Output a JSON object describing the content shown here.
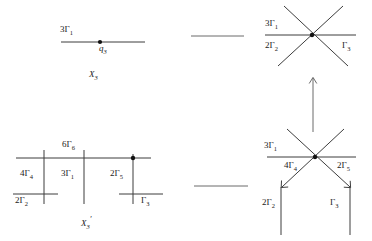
{
  "figure": {
    "title": "",
    "panels": [
      {
        "id": "top-left",
        "name": "X3-single-line",
        "bottom_label": "X",
        "bottom_label_sub": "3",
        "bottom_label_prime": "",
        "labels": [
          {
            "text": "3",
            "sub": "1",
            "greek": "Γ",
            "role": "branch-label"
          },
          {
            "text": "",
            "sub": "3",
            "greek": "q",
            "role": "point-label"
          }
        ]
      },
      {
        "id": "top-right",
        "name": "X3-star-three-branch",
        "labels": [
          {
            "text": "3",
            "sub": "1",
            "greek": "Γ"
          },
          {
            "text": "2",
            "sub": "2",
            "greek": "Γ"
          },
          {
            "text": "",
            "sub": "3",
            "greek": "Γ"
          }
        ]
      },
      {
        "id": "bottom-left",
        "name": "X3prime-comb",
        "bottom_label": "X",
        "bottom_label_sub": "3",
        "bottom_label_prime": "′",
        "labels": [
          {
            "text": "6",
            "sub": "6",
            "greek": "Γ"
          },
          {
            "text": "4",
            "sub": "4",
            "greek": "Γ"
          },
          {
            "text": "3",
            "sub": "1",
            "greek": "Γ"
          },
          {
            "text": "2",
            "sub": "5",
            "greek": "Γ"
          },
          {
            "text": "2",
            "sub": "2",
            "greek": "Γ"
          },
          {
            "text": "",
            "sub": "3",
            "greek": "Γ"
          }
        ]
      },
      {
        "id": "bottom-right",
        "name": "X3prime-star-five-branch",
        "labels": [
          {
            "text": "3",
            "sub": "1",
            "greek": "Γ"
          },
          {
            "text": "4",
            "sub": "4",
            "greek": "Γ"
          },
          {
            "text": "2",
            "sub": "5",
            "greek": "Γ"
          },
          {
            "text": "2",
            "sub": "2",
            "greek": "Γ"
          },
          {
            "text": "",
            "sub": "3",
            "greek": "Γ"
          }
        ]
      }
    ]
  },
  "top_left": {
    "branch_main": {
      "coeff": "3",
      "symbol": "Γ",
      "sub": "1"
    },
    "point": {
      "symbol": "q",
      "sub": "3"
    },
    "caption": {
      "symbol": "X",
      "sub": "3",
      "prime": ""
    }
  },
  "top_right": {
    "upper_left": {
      "coeff": "3",
      "symbol": "Γ",
      "sub": "1"
    },
    "lower_left": {
      "coeff": "2",
      "symbol": "Γ",
      "sub": "2"
    },
    "lower_right": {
      "coeff": "",
      "symbol": "Γ",
      "sub": "3"
    }
  },
  "bottom_left": {
    "top_center": {
      "coeff": "6",
      "symbol": "Γ",
      "sub": "6"
    },
    "left_mid": {
      "coeff": "4",
      "symbol": "Γ",
      "sub": "4"
    },
    "center_mid": {
      "coeff": "3",
      "symbol": "Γ",
      "sub": "1"
    },
    "right_mid": {
      "coeff": "2",
      "symbol": "Γ",
      "sub": "5"
    },
    "left_bottom": {
      "coeff": "2",
      "symbol": "Γ",
      "sub": "2"
    },
    "right_bottom": {
      "coeff": "",
      "symbol": "Γ",
      "sub": "3"
    },
    "caption": {
      "symbol": "X",
      "sub": "3",
      "prime": "′"
    }
  },
  "bottom_right": {
    "upper_left": {
      "coeff": "3",
      "symbol": "Γ",
      "sub": "1"
    },
    "inner_left": {
      "coeff": "4",
      "symbol": "Γ",
      "sub": "4"
    },
    "inner_right": {
      "coeff": "2",
      "symbol": "Γ",
      "sub": "5"
    },
    "lower_left": {
      "coeff": "2",
      "symbol": "Γ",
      "sub": "2"
    },
    "lower_right": {
      "coeff": "",
      "symbol": "Γ",
      "sub": "3"
    }
  },
  "connectors": {
    "top_horizontal": "line",
    "right_vertical_arrow": "arrow-up",
    "bottom_horizontal": "line"
  },
  "colors": {
    "line": "#3d3d3d",
    "text": "#1a1a1a",
    "background": "#ffffff"
  }
}
